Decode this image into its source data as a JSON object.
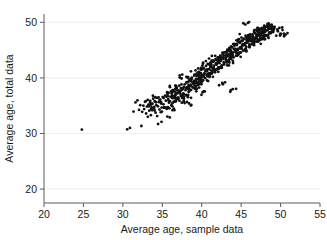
{
  "chart_data": {
    "type": "scatter",
    "title": "",
    "xlabel": "Average age, sample data",
    "ylabel": "Average age, total data",
    "xlim": [
      20,
      55
    ],
    "ylim": [
      17.5,
      51.5
    ],
    "xticks": [
      20,
      25,
      30,
      35,
      40,
      45,
      50,
      55
    ],
    "yticks": [
      20,
      30,
      40,
      50
    ],
    "xtick_labels": [
      "20",
      "25",
      "30",
      "35",
      "40",
      "45",
      "50",
      "55"
    ],
    "ytick_labels": [
      "20",
      "30",
      "40",
      "50"
    ],
    "grid": "horizontal",
    "grid_color": "#f0f0f0",
    "axis_color": "#5a5a5a",
    "marker_color": "#111111",
    "marker_size": 1.4,
    "legend": null,
    "n_points": 620,
    "points": [
      [
        24.8,
        30.7
      ],
      [
        30.55,
        30.75
      ],
      [
        30.9,
        31.0
      ],
      [
        31.35,
        33.95
      ],
      [
        31.6,
        35.6
      ],
      [
        31.85,
        35.95
      ],
      [
        32.05,
        34.25
      ],
      [
        32.2,
        35.1
      ],
      [
        32.35,
        31.35
      ],
      [
        32.45,
        33.9
      ],
      [
        32.6,
        35.0
      ],
      [
        32.7,
        34.4
      ],
      [
        32.8,
        35.7
      ],
      [
        32.95,
        33.6
      ],
      [
        33.05,
        34.85
      ],
      [
        33.15,
        36.05
      ],
      [
        33.25,
        35.2
      ],
      [
        33.35,
        34.1
      ],
      [
        33.45,
        35.55
      ],
      [
        33.55,
        33.3
      ],
      [
        33.65,
        34.7
      ],
      [
        33.75,
        35.35
      ],
      [
        33.85,
        36.25
      ],
      [
        33.95,
        34.55
      ],
      [
        34.05,
        35.8
      ],
      [
        34.15,
        33.75
      ],
      [
        34.25,
        35.1
      ],
      [
        34.35,
        36.4
      ],
      [
        34.45,
        34.9
      ],
      [
        34.55,
        35.65
      ],
      [
        34.65,
        34.3
      ],
      [
        34.75,
        36.1
      ],
      [
        34.85,
        35.4
      ],
      [
        34.95,
        33.95
      ],
      [
        35.05,
        36.55
      ],
      [
        35.15,
        35.25
      ],
      [
        35.25,
        34.65
      ],
      [
        35.35,
        36.8
      ],
      [
        35.45,
        35.9
      ],
      [
        35.55,
        34.45
      ],
      [
        35.65,
        37.1
      ],
      [
        35.75,
        36.2
      ],
      [
        35.85,
        35.55
      ],
      [
        35.95,
        38.55
      ],
      [
        36.05,
        36.6
      ],
      [
        36.15,
        35.1
      ],
      [
        36.25,
        37.4
      ],
      [
        36.35,
        36.35
      ],
      [
        36.45,
        35.7
      ],
      [
        36.55,
        37.85
      ],
      [
        36.65,
        36.9
      ],
      [
        36.75,
        35.95
      ],
      [
        36.85,
        38.2
      ],
      [
        36.95,
        37.25
      ],
      [
        37.05,
        36.4
      ],
      [
        37.15,
        38.6
      ],
      [
        37.25,
        37.55
      ],
      [
        37.35,
        36.75
      ],
      [
        37.45,
        39.9
      ],
      [
        37.55,
        38.05
      ],
      [
        37.65,
        37.1
      ],
      [
        37.75,
        36.25
      ],
      [
        37.85,
        38.85
      ],
      [
        37.95,
        37.8
      ],
      [
        38.05,
        36.95
      ],
      [
        38.15,
        39.25
      ],
      [
        38.25,
        38.35
      ],
      [
        38.35,
        37.45
      ],
      [
        38.45,
        39.6
      ],
      [
        38.55,
        38.7
      ],
      [
        38.65,
        37.85
      ],
      [
        38.75,
        40.05
      ],
      [
        38.85,
        39.1
      ],
      [
        38.95,
        38.2
      ],
      [
        39.05,
        40.4
      ],
      [
        39.15,
        39.45
      ],
      [
        39.25,
        38.55
      ],
      [
        39.35,
        40.75
      ],
      [
        39.45,
        39.8
      ],
      [
        39.55,
        38.9
      ],
      [
        39.65,
        41.1
      ],
      [
        39.75,
        40.15
      ],
      [
        39.85,
        39.25
      ],
      [
        39.95,
        41.45
      ],
      [
        40.05,
        40.5
      ],
      [
        40.15,
        39.6
      ],
      [
        40.25,
        41.8
      ],
      [
        40.35,
        40.85
      ],
      [
        40.45,
        39.95
      ],
      [
        40.55,
        42.15
      ],
      [
        40.65,
        41.2
      ],
      [
        40.75,
        40.3
      ],
      [
        40.85,
        42.5
      ],
      [
        40.95,
        41.55
      ],
      [
        41.05,
        40.65
      ],
      [
        41.15,
        42.8
      ],
      [
        41.25,
        41.9
      ],
      [
        41.35,
        41.0
      ],
      [
        41.45,
        43.1
      ],
      [
        41.55,
        42.2
      ],
      [
        41.65,
        41.3
      ],
      [
        41.75,
        43.4
      ],
      [
        41.85,
        42.5
      ],
      [
        41.95,
        41.6
      ],
      [
        42.05,
        43.7
      ],
      [
        42.15,
        42.8
      ],
      [
        42.25,
        41.9
      ],
      [
        42.35,
        44.0
      ],
      [
        42.45,
        43.1
      ],
      [
        42.55,
        42.2
      ],
      [
        42.65,
        44.3
      ],
      [
        42.75,
        43.4
      ],
      [
        42.85,
        42.5
      ],
      [
        42.95,
        44.6
      ],
      [
        43.05,
        43.7
      ],
      [
        43.15,
        42.8
      ],
      [
        43.25,
        44.9
      ],
      [
        43.35,
        44.0
      ],
      [
        43.45,
        43.1
      ],
      [
        43.55,
        45.2
      ],
      [
        43.65,
        44.3
      ],
      [
        43.75,
        43.4
      ],
      [
        43.85,
        45.5
      ],
      [
        43.95,
        44.6
      ],
      [
        44.05,
        43.7
      ],
      [
        44.15,
        45.8
      ],
      [
        44.25,
        44.9
      ],
      [
        44.35,
        44.0
      ],
      [
        44.45,
        46.1
      ],
      [
        44.55,
        45.2
      ],
      [
        44.65,
        44.3
      ],
      [
        44.75,
        46.4
      ],
      [
        44.85,
        45.5
      ],
      [
        44.95,
        44.6
      ],
      [
        45.05,
        46.7
      ],
      [
        45.15,
        45.8
      ],
      [
        45.25,
        44.9
      ],
      [
        45.35,
        47.0
      ],
      [
        45.45,
        46.1
      ],
      [
        45.55,
        45.2
      ],
      [
        45.65,
        47.3
      ],
      [
        45.75,
        46.4
      ],
      [
        45.85,
        49.9
      ],
      [
        45.95,
        46.7
      ],
      [
        46.05,
        45.8
      ],
      [
        46.15,
        47.6
      ],
      [
        46.25,
        46.95
      ],
      [
        46.35,
        46.05
      ],
      [
        46.45,
        47.85
      ],
      [
        46.55,
        47.1
      ],
      [
        46.65,
        46.3
      ],
      [
        46.75,
        48.1
      ],
      [
        46.85,
        47.35
      ],
      [
        46.95,
        46.55
      ],
      [
        47.05,
        48.35
      ],
      [
        47.15,
        47.6
      ],
      [
        47.25,
        46.8
      ],
      [
        47.35,
        48.6
      ],
      [
        47.45,
        47.85
      ],
      [
        47.55,
        47.05
      ],
      [
        47.65,
        48.85
      ],
      [
        47.75,
        48.1
      ],
      [
        47.85,
        47.3
      ],
      [
        47.95,
        49.05
      ],
      [
        48.05,
        48.35
      ],
      [
        48.15,
        47.55
      ],
      [
        48.25,
        49.25
      ],
      [
        48.35,
        48.6
      ],
      [
        48.45,
        47.8
      ],
      [
        48.55,
        49.4
      ],
      [
        48.65,
        48.85
      ],
      [
        48.75,
        48.05
      ],
      [
        48.85,
        49.55
      ],
      [
        48.95,
        49.05
      ],
      [
        49.05,
        48.25
      ],
      [
        49.25,
        49.2
      ],
      [
        49.45,
        47.6
      ],
      [
        49.65,
        48.4
      ],
      [
        49.85,
        49.0
      ],
      [
        50.05,
        47.9
      ],
      [
        50.25,
        48.6
      ],
      [
        50.45,
        47.5
      ],
      [
        50.65,
        47.8
      ],
      [
        43.95,
        38.0
      ],
      [
        42.6,
        39.1
      ],
      [
        40.1,
        37.4
      ],
      [
        38.4,
        35.4
      ],
      [
        36.3,
        34.2
      ],
      [
        34.9,
        32.1
      ],
      [
        35.95,
        32.9
      ]
    ]
  }
}
